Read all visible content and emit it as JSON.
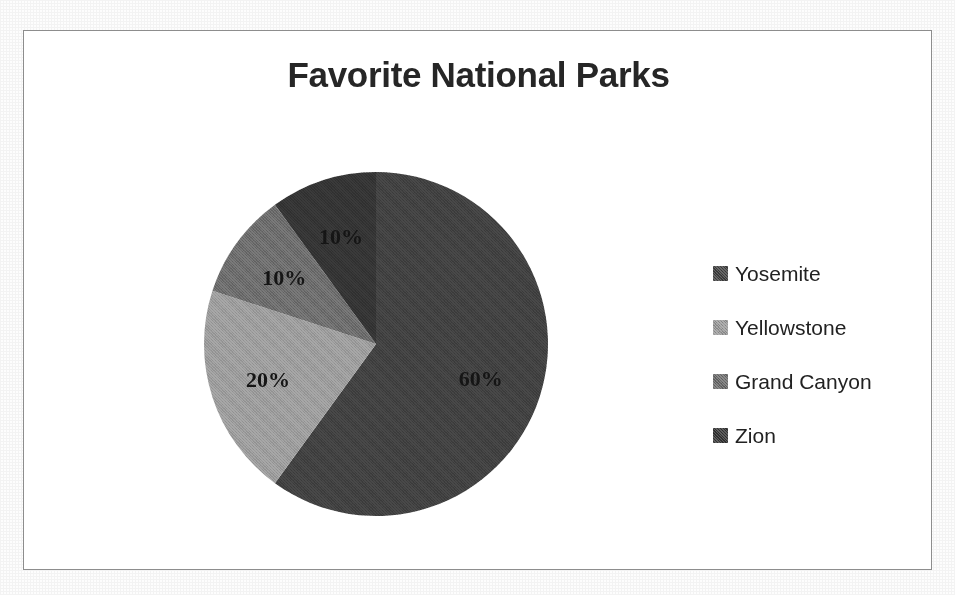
{
  "chart_data": {
    "type": "pie",
    "title": "Favorite National Parks",
    "categories": [
      "Yosemite",
      "Yellowstone",
      "Grand Canyon",
      "Zion"
    ],
    "values": [
      60,
      20,
      10,
      10
    ],
    "value_unit": "%",
    "data_labels": [
      "60%",
      "20%",
      "10%",
      "10%"
    ],
    "colors": [
      "#404040",
      "#9a9a9a",
      "#6b6b6b",
      "#333333"
    ],
    "legend_position": "right",
    "start_angle_deg": 0,
    "direction": "clockwise",
    "grid": false,
    "xlabel": "",
    "ylabel": "",
    "slices": [
      {
        "label": "Yosemite",
        "value": 60,
        "data_label": "60%",
        "color": "#404040",
        "start_deg": 0,
        "end_deg": 216,
        "label_x": 483,
        "label_y": 389
      },
      {
        "label": "Yellowstone",
        "value": 20,
        "data_label": "20%",
        "color": "#9a9a9a",
        "start_deg": 216,
        "end_deg": 288,
        "label_x": 255,
        "label_y": 380
      },
      {
        "label": "Grand Canyon",
        "value": 10,
        "data_label": "10%",
        "color": "#6b6b6b",
        "start_deg": 288,
        "end_deg": 324,
        "label_x": 265,
        "label_y": 266
      },
      {
        "label": "Zion",
        "value": 10,
        "data_label": "10%",
        "color": "#333333",
        "start_deg": 324,
        "end_deg": 360,
        "label_x": 333,
        "label_y": 210
      }
    ]
  },
  "chart": {
    "title": "Favorite National Parks",
    "frame_color": "#8d8d8d",
    "background": "#ffffff",
    "title_color": "#262626"
  },
  "legend": {
    "items": [
      {
        "label": "Yosemite",
        "color": "#404040"
      },
      {
        "label": "Yellowstone",
        "color": "#9a9a9a"
      },
      {
        "label": "Grand Canyon",
        "color": "#6b6b6b"
      },
      {
        "label": "Zion",
        "color": "#333333"
      }
    ]
  }
}
